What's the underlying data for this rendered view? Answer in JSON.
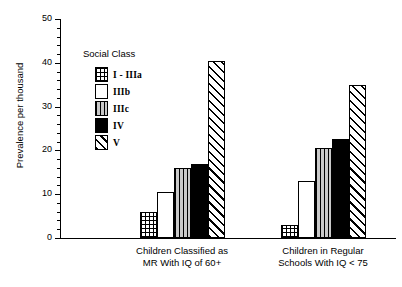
{
  "chart_data": {
    "type": "bar",
    "title": "",
    "xlabel": "",
    "ylabel": "Prevalence per thousand",
    "ylim": [
      0,
      50
    ],
    "yticks": [
      0,
      10,
      20,
      30,
      40,
      50
    ],
    "grid": false,
    "legend_title": "Social Class",
    "legend_position": "upper-left-inside",
    "categories": [
      "Children Classified as\nMR With IQ of 60+",
      "Children in Regular\nSchools With IQ < 75"
    ],
    "series": [
      {
        "name": "I - IIIa",
        "fill": "grid",
        "values": [
          6.0,
          3.0
        ]
      },
      {
        "name": "IIIb",
        "fill": "white",
        "values": [
          10.5,
          13.0
        ]
      },
      {
        "name": "IIIc",
        "fill": "vert",
        "values": [
          16.0,
          20.5
        ]
      },
      {
        "name": "IV",
        "fill": "black",
        "values": [
          17.0,
          22.5
        ]
      },
      {
        "name": "V",
        "fill": "diag",
        "values": [
          40.5,
          35.0
        ]
      }
    ]
  },
  "axis": {
    "y_title": "Prevalence per thousand",
    "y_tick_labels": [
      "0",
      "10",
      "20",
      "30",
      "40",
      "50"
    ]
  },
  "legend": {
    "title": "Social Class",
    "items": [
      {
        "label": "I - IIIa"
      },
      {
        "label": "IIIb"
      },
      {
        "label": "IIIc"
      },
      {
        "label": "IV"
      },
      {
        "label": "V"
      }
    ]
  },
  "groups": [
    {
      "line1": "Children Classified as",
      "line2": "MR With IQ of 60+"
    },
    {
      "line1": "Children in Regular",
      "line2": "Schools With IQ < 75"
    }
  ],
  "colors": {
    "ink": "#000000",
    "background": "#ffffff",
    "vertical_hatch_fill": "#c9c9c9"
  }
}
